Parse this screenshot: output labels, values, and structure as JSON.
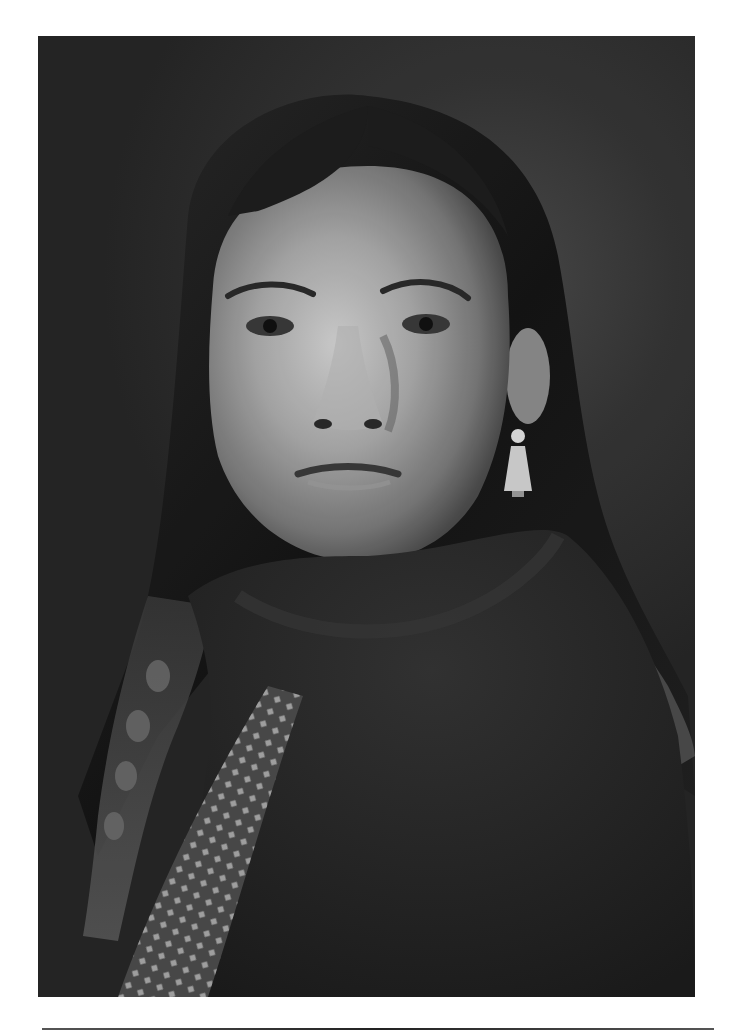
{
  "image": {
    "kind": "monochrome-portrait-photograph",
    "subject": "portrait of a woman with center-parted dark hair, braids, drop earring, dark wool shawl and patterned scarf",
    "tone": "black-and-white"
  },
  "colors": {
    "page_background": "#ffffff",
    "photo_background": "#2e2e2e",
    "skin_highlight": "#c8c8c8",
    "skin_shadow": "#6e6e6e",
    "hair": "#1a1a1a",
    "shawl": "#252525",
    "scarf_pattern": "#9a9a9a",
    "rule": "#333333"
  }
}
